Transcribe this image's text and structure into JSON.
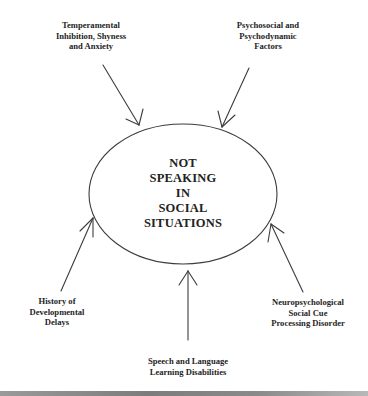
{
  "diagram": {
    "center": {
      "label": "NOT\nSPEAKING\nIN\nSOCIAL\nSITUATIONS"
    },
    "factors": [
      {
        "id": "temperamental",
        "label": "Temperamental\nInhibition, Shyness\nand Anxiety",
        "position": "top-left"
      },
      {
        "id": "psychosocial",
        "label": "Psychosocial and\nPsychodynamic\nFactors",
        "position": "top-right"
      },
      {
        "id": "developmental",
        "label": "History of\nDevelopmental\nDelays",
        "position": "bottom-left"
      },
      {
        "id": "neuropsychological",
        "label": "Neuropsychological\nSocial Cue\nProcessing Disorder",
        "position": "bottom-right"
      },
      {
        "id": "speech-language",
        "label": "Speech and Language\nLearning Disabilities",
        "position": "bottom"
      }
    ],
    "colors": {
      "line": "#3c3c3c",
      "text": "#1e1e1e",
      "background": "#ffffff"
    }
  }
}
